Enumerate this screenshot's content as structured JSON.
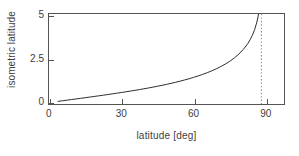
{
  "chart_data": {
    "type": "line",
    "title": "",
    "xlabel": "latitude [deg]",
    "ylabel": "isometric latitude",
    "xlim": [
      -4,
      100
    ],
    "ylim": [
      -0.15,
      5.0
    ],
    "xticks": [
      0,
      30,
      60,
      90
    ],
    "xticklabels": [
      "0",
      "30",
      "60",
      "90"
    ],
    "yticks": [
      0,
      2.5,
      5
    ],
    "yticklabels": [
      "0",
      "2.5",
      "5"
    ],
    "grid": false,
    "legend": null,
    "series": [
      {
        "name": "isometric latitude",
        "color": "#2b2b2b",
        "style": "solid",
        "x": [
          0,
          2,
          4,
          6,
          8,
          10,
          12,
          14,
          16,
          18,
          20,
          22,
          24,
          26,
          28,
          30,
          32,
          34,
          36,
          38,
          40,
          42,
          44,
          46,
          48,
          50,
          52,
          54,
          56,
          58,
          60,
          62,
          64,
          66,
          68,
          70,
          72,
          74,
          76,
          78,
          80,
          82,
          84,
          85,
          86,
          87,
          88,
          88.5,
          89,
          89.2,
          89.4
        ],
        "y": [
          0.0,
          0.035,
          0.07,
          0.105,
          0.14,
          0.175,
          0.21,
          0.245,
          0.281,
          0.317,
          0.354,
          0.391,
          0.429,
          0.468,
          0.507,
          0.547,
          0.589,
          0.631,
          0.675,
          0.72,
          0.767,
          0.815,
          0.866,
          0.918,
          0.973,
          1.031,
          1.092,
          1.156,
          1.224,
          1.296,
          1.373,
          1.456,
          1.545,
          1.641,
          1.746,
          1.861,
          1.989,
          2.132,
          2.294,
          2.482,
          2.703,
          2.971,
          3.313,
          3.528,
          3.784,
          4.105,
          4.541,
          4.83,
          5.23,
          5.45,
          5.75
        ],
        "note": "Mercator isometric latitude psi = ln(tan(45deg + phi/2)); asymptotic at 90 deg"
      }
    ],
    "annotations": [
      {
        "name": "asymptote",
        "type": "vertical-line",
        "x": 90,
        "style": "dotted",
        "color": "#8c8c8c"
      }
    ]
  }
}
